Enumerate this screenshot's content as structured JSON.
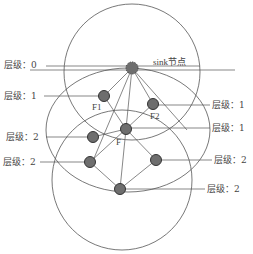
{
  "diagram": {
    "sink_label": "sink节点",
    "level_labels": [
      {
        "id": "left-level-0",
        "text": "层级：0"
      },
      {
        "id": "left-level-1",
        "text": "层级：1"
      },
      {
        "id": "left-level-2a",
        "text": "层级：2"
      },
      {
        "id": "left-level-2b",
        "text": "层级：2"
      },
      {
        "id": "right-level-1a",
        "text": "层级：1"
      },
      {
        "id": "right-level-1b",
        "text": "层级：1"
      },
      {
        "id": "right-level-2a",
        "text": "层级：2"
      },
      {
        "id": "right-level-2b",
        "text": "层级：2"
      }
    ],
    "node_labels": {
      "F1": "F1",
      "F2": "F2",
      "F": "F"
    },
    "colors": {
      "node_fill": "#6e6e6e",
      "node_stroke": "#333333",
      "line": "#555555",
      "circle": "#555555"
    }
  }
}
